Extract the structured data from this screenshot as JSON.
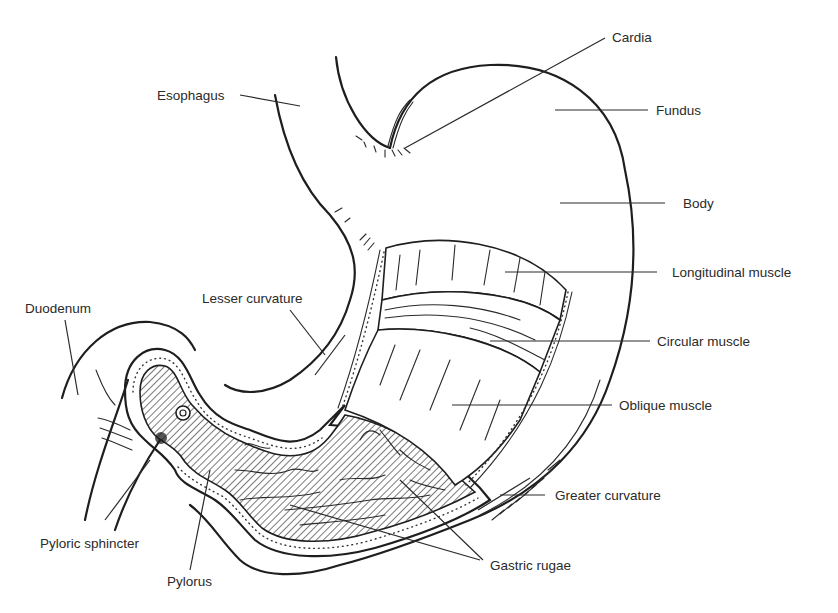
{
  "figure": {
    "labels": {
      "cardia": "Cardia",
      "esophagus": "Esophagus",
      "fundus": "Fundus",
      "body": "Body",
      "longitudinal_muscle": "Longitudinal muscle",
      "lesser_curvature": "Lesser curvature",
      "duodenum": "Duodenum",
      "circular_muscle": "Circular muscle",
      "oblique_muscle": "Oblique muscle",
      "greater_curvature": "Greater curvature",
      "pyloric_sphincter": "Pyloric sphincter",
      "pylorus": "Pylorus",
      "gastric_rugae": "Gastric rugae"
    },
    "colors": {
      "line": "#1e1e1e",
      "text": "#2a2a2a",
      "background": "#ffffff"
    }
  }
}
